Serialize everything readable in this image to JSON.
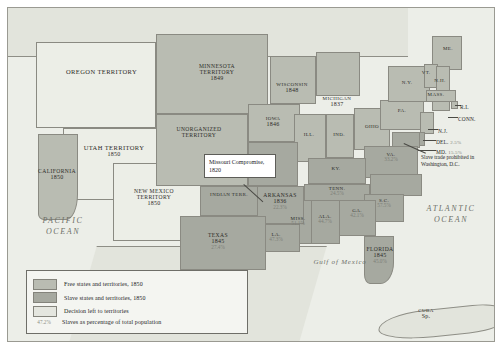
{
  "map": {
    "oceans": [
      {
        "name": "pacific-ocean-label",
        "text": "PACIFIC\nOCEAN"
      },
      {
        "name": "atlantic-ocean-label",
        "text": "ATLANTIC\nOCEAN"
      },
      {
        "name": "gulf-of-mexico-label",
        "text": "Gulf of Mexico"
      }
    ],
    "countries": [
      {
        "name": "mexico-label",
        "text": "MEXICO"
      }
    ],
    "cuba": {
      "name": "CUBA",
      "note": "Sp."
    },
    "callout": {
      "text": "Missouri Compromise, 1820"
    },
    "dc_note": {
      "text": "Slave trade prohibited in Washington, D.C."
    }
  },
  "regions": [
    {
      "id": "oregon-territory",
      "name": "OREGON TERRITORY",
      "year": "",
      "pct": "",
      "status": "open"
    },
    {
      "id": "utah-territory",
      "name": "UTAH TERRITORY",
      "year": "1850",
      "pct": "",
      "status": "open"
    },
    {
      "id": "california",
      "name": "CALIFORNIA",
      "year": "1850",
      "pct": "",
      "status": "free"
    },
    {
      "id": "new-mexico-territory",
      "name": "NEW MEXICO TERRITORY",
      "year": "1850",
      "pct": "",
      "status": "open"
    },
    {
      "id": "minnesota-territory",
      "name": "MINNESOTA TERRITORY",
      "year": "1849",
      "pct": "",
      "status": "free"
    },
    {
      "id": "unorganized-territory",
      "name": "UNORGANIZED TERRITORY",
      "year": "",
      "pct": "",
      "status": "free"
    },
    {
      "id": "wisconsin",
      "name": "WISCONSIN",
      "year": "1848",
      "pct": "",
      "status": "free"
    },
    {
      "id": "iowa",
      "name": "IOWA",
      "year": "1846",
      "pct": "",
      "status": "free"
    },
    {
      "id": "michigan",
      "name": "MICHIGAN",
      "year": "1837",
      "pct": "",
      "status": "free"
    },
    {
      "id": "illinois",
      "name": "ILL.",
      "year": "",
      "pct": "",
      "status": "free"
    },
    {
      "id": "indiana",
      "name": "IND.",
      "year": "",
      "pct": "",
      "status": "free"
    },
    {
      "id": "ohio",
      "name": "OHIO",
      "year": "",
      "pct": "",
      "status": "free"
    },
    {
      "id": "pennsylvania",
      "name": "PA.",
      "year": "",
      "pct": "",
      "status": "free"
    },
    {
      "id": "new-york",
      "name": "N.Y.",
      "year": "",
      "pct": "",
      "status": "free"
    },
    {
      "id": "maine",
      "name": "ME.",
      "year": "",
      "pct": "",
      "status": "free"
    },
    {
      "id": "vermont",
      "name": "VT.",
      "year": "",
      "pct": "",
      "status": "free"
    },
    {
      "id": "new-hampshire",
      "name": "N.H.",
      "year": "",
      "pct": "",
      "status": "free"
    },
    {
      "id": "massachusetts",
      "name": "MASS.",
      "year": "",
      "pct": "",
      "status": "free"
    },
    {
      "id": "rhode-island",
      "name": "R.I.",
      "year": "",
      "pct": "",
      "status": "free"
    },
    {
      "id": "connecticut",
      "name": "CONN.",
      "year": "",
      "pct": "",
      "status": "free"
    },
    {
      "id": "new-jersey",
      "name": "N.J.",
      "year": "",
      "pct": "",
      "status": "free"
    },
    {
      "id": "delaware",
      "name": "DEL.",
      "year": "",
      "pct": "2.5%",
      "status": "slave"
    },
    {
      "id": "maryland",
      "name": "MD.",
      "year": "",
      "pct": "15.5%",
      "status": "slave"
    },
    {
      "id": "virginia",
      "name": "VA.",
      "year": "",
      "pct": "33.2%",
      "status": "slave"
    },
    {
      "id": "kentucky",
      "name": "KY.",
      "year": "",
      "pct": "",
      "status": "slave"
    },
    {
      "id": "missouri",
      "name": "MO.",
      "year": "",
      "pct": "",
      "status": "slave"
    },
    {
      "id": "tennessee",
      "name": "TENN.",
      "year": "",
      "pct": "24.5%",
      "status": "slave"
    },
    {
      "id": "north-carolina",
      "name": "N.C.",
      "year": "",
      "pct": "",
      "status": "slave"
    },
    {
      "id": "south-carolina",
      "name": "S.C.",
      "year": "",
      "pct": "57.5%",
      "status": "slave"
    },
    {
      "id": "georgia",
      "name": "GA.",
      "year": "",
      "pct": "42.1%",
      "status": "slave"
    },
    {
      "id": "alabama",
      "name": "ALA.",
      "year": "",
      "pct": "44.7%",
      "status": "slave"
    },
    {
      "id": "mississippi",
      "name": "MISS.",
      "year": "",
      "pct": "51.1%",
      "status": "slave"
    },
    {
      "id": "arkansas",
      "name": "ARKANSAS",
      "year": "1836",
      "pct": "22.3%",
      "status": "slave"
    },
    {
      "id": "louisiana",
      "name": "LA.",
      "year": "",
      "pct": "47.3%",
      "status": "slave"
    },
    {
      "id": "texas",
      "name": "TEXAS",
      "year": "1845",
      "pct": "27.4%",
      "status": "slave"
    },
    {
      "id": "florida",
      "name": "FLORIDA",
      "year": "1845",
      "pct": "45.0%",
      "status": "slave"
    },
    {
      "id": "indian-territory",
      "name": "INDIAN TERR.",
      "year": "",
      "pct": "",
      "status": "slave"
    }
  ],
  "legend": {
    "items": [
      {
        "key": "free",
        "swatch": "free",
        "label": "Free states and territories, 1850"
      },
      {
        "key": "slave",
        "swatch": "slave",
        "label": "Slave states and territories, 1850"
      },
      {
        "key": "open",
        "swatch": "open",
        "label": "Decision left to territories"
      },
      {
        "key": "pct",
        "swatch": "pct",
        "sample": "47.2%",
        "label": "Slaves as percentage of total population"
      }
    ]
  }
}
